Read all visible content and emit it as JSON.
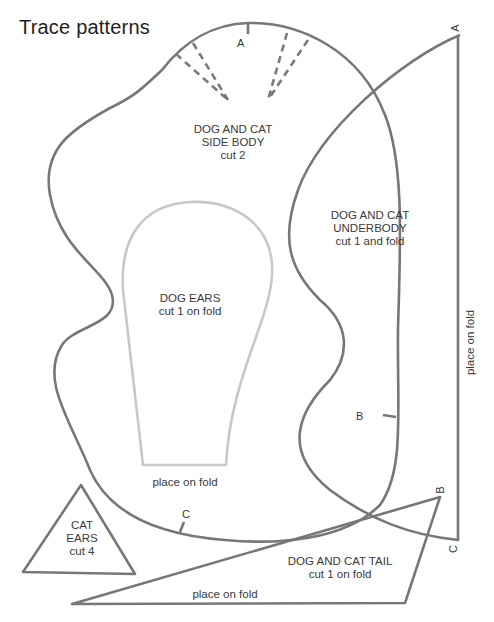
{
  "title": "Trace patterns",
  "pieces": {
    "side_body": {
      "line1": "DOG AND CAT",
      "line2": "SIDE BODY",
      "line3": "cut 2"
    },
    "underbody": {
      "line1": "DOG AND CAT",
      "line2": "UNDERBODY",
      "line3": "cut 1 and fold",
      "fold_label": "place on fold"
    },
    "dog_ears": {
      "line1": "DOG EARS",
      "line2": "cut 1 on fold",
      "fold_label": "place on fold"
    },
    "cat_ears": {
      "line1": "CAT",
      "line2": "EARS",
      "line3": "cut 4"
    },
    "tail": {
      "line1": "DOG AND CAT TAIL",
      "line2": "cut 1 on fold",
      "fold_label": "place on fold"
    }
  },
  "markers": {
    "side_a": "A",
    "side_c": "C",
    "under_a": "A",
    "under_b": "B",
    "under_c": "C",
    "tail_b": "B"
  }
}
